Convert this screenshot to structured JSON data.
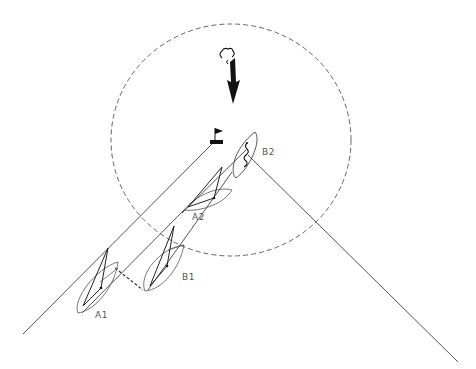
{
  "diagram": {
    "type": "sailing-rules-diagram",
    "colors": {
      "line": "#555555",
      "dashed": "#666666",
      "ink": "#111111",
      "background": "#ffffff"
    },
    "zone_circle": {
      "cx": 231,
      "cy": 140,
      "rx": 120,
      "ry": 116,
      "style": "dashed"
    },
    "wind_arrow": {
      "x": 233,
      "from_y": 55,
      "to_y": 104,
      "icon": "wind-arrow-icon"
    },
    "mark": {
      "x": 216,
      "y": 140,
      "icon": "flag-mark-icon"
    },
    "layline_left": {
      "x1": 23,
      "y1": 334,
      "x2": 215,
      "y2": 141
    },
    "layline_right": {
      "x1": 248,
      "y1": 155,
      "x2": 458,
      "y2": 362
    },
    "boats": [
      {
        "id": "A1",
        "label": "A1",
        "label_x": 95,
        "label_y": 310
      },
      {
        "id": "B1",
        "label": "B1",
        "label_x": 182,
        "label_y": 272
      },
      {
        "id": "A2",
        "label": "A2",
        "label_x": 192,
        "label_y": 212
      },
      {
        "id": "B2",
        "label": "B2",
        "label_x": 262,
        "label_y": 147
      }
    ]
  }
}
